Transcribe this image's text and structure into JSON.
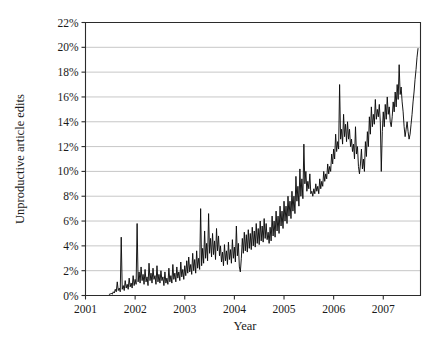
{
  "chart_data": {
    "type": "line",
    "title": "",
    "xlabel": "Year",
    "ylabel": "Unproductive article edits",
    "xlim": [
      2001.0,
      2007.75
    ],
    "ylim": [
      0,
      22
    ],
    "grid": true,
    "legend": false,
    "y_tick_labels": [
      "0%",
      "2%",
      "4%",
      "6%",
      "8%",
      "10%",
      "12%",
      "14%",
      "16%",
      "18%",
      "20%",
      "22%"
    ],
    "y_tick_values": [
      0,
      2,
      4,
      6,
      8,
      10,
      12,
      14,
      16,
      18,
      20,
      22
    ],
    "x_tick_labels": [
      "2001",
      "2002",
      "2003",
      "2004",
      "2005",
      "2006",
      "2007"
    ],
    "x_tick_values": [
      2001,
      2002,
      2003,
      2004,
      2005,
      2006,
      2007
    ],
    "series": [
      {
        "name": "Unproductive article edits",
        "x": [
          2001.48,
          2001.5,
          2001.52,
          2001.54,
          2001.56,
          2001.58,
          2001.6,
          2001.62,
          2001.64,
          2001.66,
          2001.68,
          2001.7,
          2001.72,
          2001.74,
          2001.76,
          2001.78,
          2001.8,
          2001.82,
          2001.84,
          2001.86,
          2001.88,
          2001.9,
          2001.92,
          2001.94,
          2001.96,
          2001.98,
          2002.0,
          2002.02,
          2002.04,
          2002.06,
          2002.08,
          2002.1,
          2002.12,
          2002.14,
          2002.16,
          2002.18,
          2002.2,
          2002.22,
          2002.24,
          2002.26,
          2002.28,
          2002.3,
          2002.32,
          2002.34,
          2002.36,
          2002.38,
          2002.4,
          2002.42,
          2002.44,
          2002.46,
          2002.48,
          2002.5,
          2002.52,
          2002.54,
          2002.56,
          2002.58,
          2002.6,
          2002.62,
          2002.64,
          2002.66,
          2002.68,
          2002.7,
          2002.72,
          2002.74,
          2002.76,
          2002.78,
          2002.8,
          2002.82,
          2002.84,
          2002.86,
          2002.88,
          2002.9,
          2002.92,
          2002.94,
          2002.96,
          2002.98,
          2003.0,
          2003.02,
          2003.04,
          2003.06,
          2003.08,
          2003.1,
          2003.12,
          2003.14,
          2003.16,
          2003.18,
          2003.2,
          2003.22,
          2003.24,
          2003.26,
          2003.28,
          2003.3,
          2003.32,
          2003.34,
          2003.36,
          2003.38,
          2003.4,
          2003.42,
          2003.44,
          2003.46,
          2003.48,
          2003.5,
          2003.52,
          2003.54,
          2003.56,
          2003.58,
          2003.6,
          2003.62,
          2003.64,
          2003.66,
          2003.68,
          2003.7,
          2003.72,
          2003.74,
          2003.76,
          2003.78,
          2003.8,
          2003.82,
          2003.84,
          2003.86,
          2003.88,
          2003.9,
          2003.92,
          2003.94,
          2003.96,
          2003.98,
          2004.0,
          2004.02,
          2004.04,
          2004.06,
          2004.08,
          2004.1,
          2004.12,
          2004.14,
          2004.16,
          2004.18,
          2004.2,
          2004.22,
          2004.24,
          2004.26,
          2004.28,
          2004.3,
          2004.32,
          2004.34,
          2004.36,
          2004.38,
          2004.4,
          2004.42,
          2004.44,
          2004.46,
          2004.48,
          2004.5,
          2004.52,
          2004.54,
          2004.56,
          2004.58,
          2004.6,
          2004.62,
          2004.64,
          2004.66,
          2004.68,
          2004.7,
          2004.72,
          2004.74,
          2004.76,
          2004.78,
          2004.8,
          2004.82,
          2004.84,
          2004.86,
          2004.88,
          2004.9,
          2004.92,
          2004.94,
          2004.96,
          2004.98,
          2005.0,
          2005.02,
          2005.04,
          2005.06,
          2005.08,
          2005.1,
          2005.12,
          2005.14,
          2005.16,
          2005.18,
          2005.2,
          2005.22,
          2005.24,
          2005.26,
          2005.28,
          2005.3,
          2005.32,
          2005.34,
          2005.36,
          2005.38,
          2005.4,
          2005.42,
          2005.44,
          2005.46,
          2005.48,
          2005.5,
          2005.52,
          2005.54,
          2005.56,
          2005.58,
          2005.6,
          2005.62,
          2005.64,
          2005.66,
          2005.68,
          2005.7,
          2005.72,
          2005.74,
          2005.76,
          2005.78,
          2005.8,
          2005.82,
          2005.84,
          2005.86,
          2005.88,
          2005.9,
          2005.92,
          2005.94,
          2005.96,
          2005.98,
          2006.0,
          2006.02,
          2006.04,
          2006.06,
          2006.08,
          2006.1,
          2006.12,
          2006.14,
          2006.16,
          2006.18,
          2006.2,
          2006.22,
          2006.24,
          2006.26,
          2006.28,
          2006.3,
          2006.32,
          2006.34,
          2006.36,
          2006.38,
          2006.4,
          2006.42,
          2006.44,
          2006.46,
          2006.48,
          2006.5,
          2006.52,
          2006.54,
          2006.56,
          2006.58,
          2006.6,
          2006.62,
          2006.64,
          2006.66,
          2006.68,
          2006.7,
          2006.72,
          2006.74,
          2006.76,
          2006.78,
          2006.8,
          2006.82,
          2006.84,
          2006.86,
          2006.88,
          2006.9,
          2006.92,
          2006.94,
          2006.96,
          2006.98,
          2007.0,
          2007.02,
          2007.04,
          2007.06,
          2007.08,
          2007.1,
          2007.12,
          2007.14,
          2007.16,
          2007.18,
          2007.2,
          2007.22,
          2007.24,
          2007.26,
          2007.28,
          2007.3,
          2007.32,
          2007.34,
          2007.36,
          2007.38,
          2007.4,
          2007.42,
          2007.44,
          2007.46,
          2007.48,
          2007.5,
          2007.52,
          2007.54,
          2007.56,
          2007.58,
          2007.6,
          2007.62,
          2007.64,
          2007.66,
          2007.68,
          2007.7
        ],
        "values": [
          0.1,
          0.1,
          0.2,
          0.1,
          0.3,
          0.2,
          0.5,
          0.3,
          1.1,
          0.4,
          0.6,
          0.3,
          4.7,
          0.5,
          0.8,
          0.4,
          1.2,
          0.6,
          0.9,
          0.5,
          1.4,
          0.7,
          1.0,
          0.6,
          1.6,
          0.8,
          1.3,
          0.9,
          5.8,
          1.1,
          1.9,
          1.0,
          2.3,
          1.2,
          1.7,
          0.9,
          2.1,
          1.1,
          1.5,
          0.8,
          2.6,
          1.2,
          1.8,
          1.0,
          2.2,
          1.3,
          1.6,
          0.9,
          2.4,
          1.1,
          1.7,
          1.0,
          2.0,
          1.2,
          1.5,
          0.8,
          1.9,
          1.0,
          1.4,
          0.9,
          2.2,
          1.1,
          1.6,
          1.0,
          2.5,
          1.3,
          1.8,
          1.1,
          2.3,
          1.4,
          1.9,
          1.2,
          2.7,
          1.5,
          2.1,
          1.3,
          2.4,
          1.6,
          2.8,
          1.8,
          3.1,
          1.9,
          2.5,
          1.7,
          3.4,
          2.0,
          2.9,
          1.8,
          3.6,
          2.2,
          3.0,
          2.1,
          7.0,
          2.4,
          3.8,
          2.6,
          5.2,
          3.0,
          4.2,
          2.8,
          6.6,
          3.4,
          4.6,
          3.1,
          5.0,
          3.3,
          4.4,
          2.9,
          5.4,
          3.6,
          4.8,
          3.2,
          4.0,
          2.7,
          3.5,
          2.4,
          4.1,
          2.8,
          3.6,
          2.5,
          4.3,
          2.9,
          3.7,
          2.6,
          4.5,
          3.0,
          3.9,
          2.7,
          5.6,
          3.2,
          4.2,
          2.3,
          1.9,
          3.0,
          4.6,
          3.4,
          5.1,
          3.6,
          4.9,
          3.5,
          5.3,
          3.8,
          5.0,
          3.7,
          5.5,
          4.0,
          5.2,
          3.9,
          5.8,
          4.2,
          5.4,
          4.1,
          6.0,
          4.4,
          5.6,
          4.3,
          6.2,
          4.6,
          5.8,
          4.5,
          5.1,
          4.2,
          5.5,
          4.4,
          6.4,
          4.8,
          6.0,
          4.7,
          6.8,
          5.2,
          6.4,
          5.0,
          7.2,
          5.6,
          6.8,
          5.4,
          7.6,
          6.0,
          7.2,
          5.8,
          8.0,
          6.4,
          7.6,
          6.2,
          8.4,
          6.8,
          8.0,
          6.6,
          9.6,
          7.6,
          8.8,
          7.2,
          10.2,
          8.0,
          9.4,
          7.8,
          12.2,
          9.0,
          10.0,
          8.4,
          9.2,
          8.6,
          9.8,
          8.2,
          8.4,
          8.0,
          8.6,
          8.2,
          9.0,
          8.4,
          8.8,
          8.2,
          9.4,
          8.6,
          9.2,
          8.8,
          10.0,
          9.2,
          9.8,
          9.4,
          10.6,
          9.8,
          10.4,
          10.0,
          11.4,
          10.6,
          11.8,
          11.0,
          13.0,
          11.6,
          12.4,
          11.8,
          17.0,
          12.6,
          13.4,
          12.2,
          14.6,
          12.8,
          13.8,
          12.4,
          14.0,
          12.6,
          13.4,
          12.0,
          12.6,
          11.6,
          12.2,
          11.0,
          13.6,
          11.4,
          12.0,
          10.4,
          9.8,
          10.6,
          11.8,
          10.2,
          11.0,
          10.0,
          12.4,
          11.2,
          13.2,
          12.0,
          14.4,
          13.0,
          15.2,
          13.6,
          14.6,
          13.8,
          15.8,
          14.2,
          15.0,
          14.4,
          15.4,
          14.0,
          10.0,
          13.2,
          14.8,
          13.6,
          15.4,
          14.2,
          16.0,
          14.6,
          15.2,
          14.0,
          13.6,
          14.4,
          15.6,
          14.8,
          16.4,
          15.2,
          17.0,
          15.8,
          18.6,
          16.2,
          16.8,
          15.6,
          14.8,
          13.6,
          12.8,
          13.4,
          14.0,
          13.2,
          12.6,
          13.0,
          13.8,
          14.6,
          15.6,
          16.4,
          17.4,
          18.2,
          19.2,
          19.9
        ]
      }
    ]
  }
}
